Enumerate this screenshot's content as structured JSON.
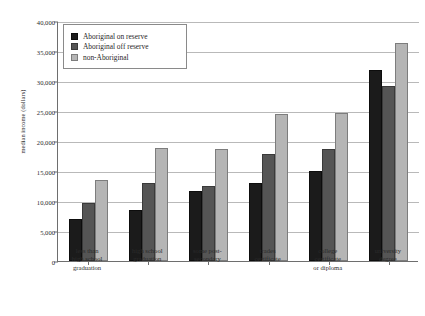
{
  "chart_data": {
    "type": "bar",
    "title": "",
    "xlabel": "",
    "ylabel": "median income (dollars)",
    "ylim": [
      0,
      40000
    ],
    "ytick_labels": [
      "0",
      "5,000",
      "10,000",
      "15,000",
      "20,000",
      "25,000",
      "30,000",
      "35,000",
      "40,000"
    ],
    "ytick_values": [
      0,
      5000,
      10000,
      15000,
      20000,
      25000,
      30000,
      35000,
      40000
    ],
    "grid": true,
    "legend_position": "top-left",
    "categories": [
      "less than high school graduation",
      "high school graduation",
      "some post-secondary",
      "trades certificate",
      "college certificate or diploma",
      "university degree"
    ],
    "category_lines": [
      [
        "less than",
        "high school",
        "graduation"
      ],
      [
        "high school",
        "graduation"
      ],
      [
        "some post-",
        "secondary"
      ],
      [
        "trades",
        "certificate"
      ],
      [
        "college",
        "certificate",
        "or diploma"
      ],
      [
        "university",
        "degree"
      ]
    ],
    "series": [
      {
        "name": "Aboriginal on reserve",
        "color": "#1b1b1b",
        "values": [
          7000,
          8500,
          11700,
          13000,
          15000,
          31800
        ]
      },
      {
        "name": "Aboriginal off reserve",
        "color": "#555555",
        "values": [
          9600,
          13000,
          12500,
          17800,
          18600,
          29200
        ]
      },
      {
        "name": "non-Aboriginal",
        "color": "#b5b5b5",
        "values": [
          13500,
          18800,
          18700,
          24500,
          24700,
          36300
        ]
      }
    ]
  }
}
